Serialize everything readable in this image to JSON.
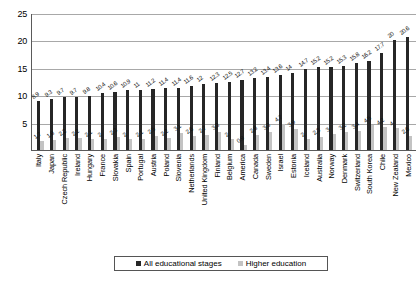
{
  "chart_data": {
    "type": "bar",
    "title": "",
    "subtitle": "",
    "xlabel": "",
    "ylabel": "",
    "ylim": [
      0,
      25
    ],
    "yticks": [
      0,
      5,
      10,
      15,
      20,
      25
    ],
    "grid": true,
    "legend_position": "bottom",
    "categories": [
      "Italy",
      "Japan",
      "Czech Republic",
      "Ireland",
      "Hungary",
      "France",
      "Slovakia",
      "Spain",
      "Portugal",
      "Austria",
      "Poland",
      "Slovenia",
      "Netherlands",
      "United Kingdom",
      "Finland",
      "Belgium",
      "America",
      "Canada",
      "Sweden",
      "Israel",
      "Estonia",
      "Iceland",
      "Australia",
      "Norway",
      "Denmark",
      "Switzerland",
      "South Korea",
      "Chile",
      "New Zealand",
      "Mexico"
    ],
    "series": [
      {
        "name": "All educational stages",
        "color": "#262626",
        "values": [
          8.9,
          9.3,
          9.7,
          9.7,
          9.8,
          10.4,
          10.6,
          10.9,
          11,
          11.2,
          11.4,
          11.4,
          11.6,
          12,
          12.3,
          12.5,
          12.7,
          13.2,
          13.4,
          13.6,
          14,
          14.7,
          15.2,
          15.2,
          15.3,
          15.8,
          16.2,
          17.7,
          20,
          20.6
        ]
      },
      {
        "name": "Higher education",
        "color": "#c3c3c3",
        "values": [
          1.7,
          1.8,
          2.2,
          2.2,
          2.1,
          2,
          2.3,
          2,
          2.1,
          2.5,
          2.2,
          3.1,
          2.6,
          2.7,
          3.3,
          2,
          0.9,
          2.8,
          3.3,
          4.7,
          3.9,
          2,
          2.3,
          3,
          3.2,
          3.4,
          4.5,
          4.2,
          4,
          2.6
        ]
      }
    ],
    "legend": [
      {
        "label": "All educational stages",
        "color": "#262626"
      },
      {
        "label": "Higher education",
        "color": "#c3c3c3"
      }
    ]
  }
}
